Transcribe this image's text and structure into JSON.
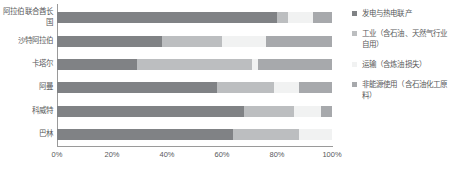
{
  "chart_data": {
    "type": "bar",
    "orientation": "horizontal",
    "stacked": true,
    "normalized_percent": true,
    "title": "",
    "subtitle": "",
    "xlabel": "",
    "ylabel": "",
    "xlim": [
      0,
      100
    ],
    "xticks": [
      0,
      20,
      40,
      60,
      80,
      100
    ],
    "xtick_labels": [
      "0%",
      "20%",
      "40%",
      "60%",
      "80%",
      "100%"
    ],
    "grid": false,
    "legend_position": "right",
    "categories": [
      "阿拉伯联合酋长国",
      "沙特阿拉伯",
      "卡塔尔",
      "阿曼",
      "科威特",
      "巴林"
    ],
    "series": [
      {
        "name": "发电与热电联产",
        "color": "#808285",
        "values": [
          80,
          38,
          29,
          58,
          68,
          64
        ]
      },
      {
        "name": "工业（含石油、天然气行业自用）",
        "color": "#bcbec0",
        "values": [
          4,
          22,
          42,
          21,
          18,
          24
        ]
      },
      {
        "name": "运输（含炼油损失）",
        "color": "#f1f2f2",
        "values": [
          9,
          16,
          2,
          9,
          10,
          12
        ]
      },
      {
        "name": "非能源使用（含石油化工原料）",
        "color": "#a7a9ac",
        "values": [
          7,
          24,
          27,
          12,
          4,
          0
        ]
      }
    ]
  },
  "axis": {
    "tick_labels": [
      "0%",
      "20%",
      "40%",
      "60%",
      "80%",
      "100%"
    ]
  },
  "legend": {
    "items": [
      {
        "label": "发电与热电联产",
        "color": "#808285"
      },
      {
        "label": "工业（含石油、天然气行业自用）",
        "color": "#bcbec0"
      },
      {
        "label": "运输（含炼油损失）",
        "color": "#f1f2f2"
      },
      {
        "label": "非能源使用（含石油化工原料）",
        "color": "#a7a9ac"
      }
    ]
  }
}
